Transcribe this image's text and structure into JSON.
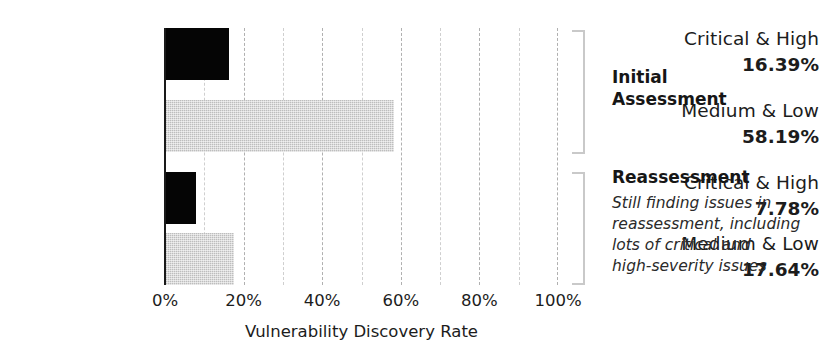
{
  "chart_data": {
    "type": "bar",
    "orientation": "horizontal",
    "title": "",
    "xlabel": "Vulnerability Discovery Rate",
    "ylabel": "",
    "xlim": [
      0,
      100
    ],
    "xticks": [
      "0%",
      "20%",
      "40%",
      "60%",
      "80%",
      "100%"
    ],
    "xtick_values": [
      0,
      20,
      40,
      60,
      80,
      100
    ],
    "grid": "vertical dashed gridlines every 10%",
    "legend": "none",
    "categories": [
      "Critical & High",
      "Medium & Low",
      "Critical & High",
      "Medium & Low"
    ],
    "values": [
      16.39,
      58.19,
      7.78,
      17.64
    ],
    "value_labels": [
      "16.39%",
      "58.19%",
      "7.78%",
      "17.64%"
    ],
    "bars": [
      {
        "category": "Critical & High",
        "value": 16.39,
        "label": "16.39%",
        "style": "dark",
        "group": "Initial Assessment"
      },
      {
        "category": "Medium & Low",
        "value": 58.19,
        "label": "58.19%",
        "style": "light",
        "group": "Initial Assessment"
      },
      {
        "category": "Critical & High",
        "value": 7.78,
        "label": "7.78%",
        "style": "dark",
        "group": "Reassessment"
      },
      {
        "category": "Medium & Low",
        "value": 17.64,
        "label": "17.64%",
        "style": "light",
        "group": "Reassessment"
      }
    ],
    "groups": [
      {
        "name": "Initial Assessment",
        "title": "Initial\nAssessment",
        "note": "",
        "bar_indices": [
          0,
          1
        ]
      },
      {
        "name": "Reassessment",
        "title": "Reassessment",
        "note": "Still finding issues in\nreassessment, including\nlots of critical and\nhigh-severity issues",
        "bar_indices": [
          2,
          3
        ]
      }
    ],
    "colors": {
      "dark_bar": "#050505",
      "light_bar": "#bdbdbd",
      "gridline": "#b0b0b0",
      "axis": "#1a1a1a",
      "bracket": "#c9c9c9",
      "text": "#1c1c1c",
      "background": "#ffffff"
    }
  }
}
